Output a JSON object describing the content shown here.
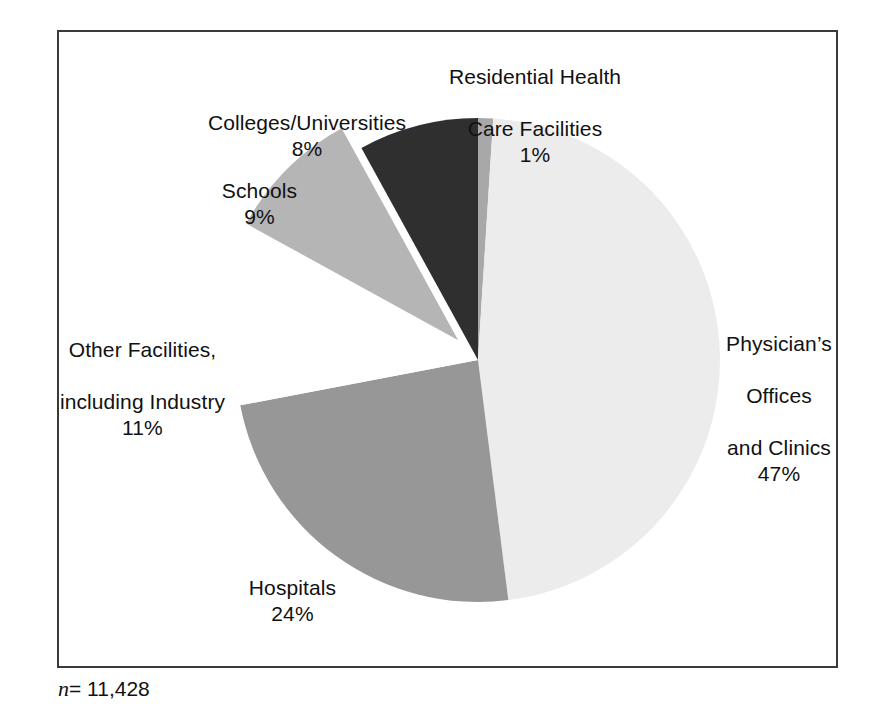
{
  "figure": {
    "footnote_symbol": "n",
    "footnote_value": "= 11,428",
    "frame_color": "#3a3a3a",
    "background": "#ffffff"
  },
  "chart_data": {
    "type": "pie",
    "title": "",
    "subtitle": "",
    "xlabel": "",
    "ylabel": "",
    "legend_position": "none",
    "grid": false,
    "total_label": "n = 11,428",
    "total": 11428,
    "start_angle_deg": 0,
    "direction": "clockwise",
    "categories": [
      "Residential Health Care Facilities",
      "Physician's Offices and Clinics",
      "Hospitals",
      "Other Facilities, including Industry",
      "Schools",
      "Colleges/Universities"
    ],
    "values": [
      1,
      47,
      24,
      11,
      9,
      8
    ],
    "value_labels": [
      "1%",
      "47%",
      "24%",
      "11%",
      "9%",
      "8%"
    ],
    "colors": [
      "#a8a8a8",
      "#ececec",
      "#979797",
      "#ffffff",
      "#b5b5b5",
      "#2f2f2f"
    ],
    "exploded": [
      false,
      false,
      false,
      false,
      true,
      false
    ],
    "slices": [
      {
        "name": "Residential Health Care Facilities",
        "label_line1": "Residential Health",
        "label_line2": "Care Facilities",
        "percent_label": "1%",
        "value": 1,
        "color": "#a8a8a8",
        "exploded": false
      },
      {
        "name": "Physician's Offices and Clinics",
        "label_line1": "Physician’s",
        "label_line2": "Offices",
        "label_line3": "and Clinics",
        "percent_label": "47%",
        "value": 47,
        "color": "#ececec",
        "exploded": false
      },
      {
        "name": "Hospitals",
        "label_line1": "Hospitals",
        "percent_label": "24%",
        "value": 24,
        "color": "#979797",
        "exploded": false
      },
      {
        "name": "Other Facilities, including Industry",
        "label_line1": "Other Facilities,",
        "label_line2": "including Industry",
        "percent_label": "11%",
        "value": 11,
        "color": "#ffffff",
        "exploded": false
      },
      {
        "name": "Schools",
        "label_line1": "Schools",
        "percent_label": "9%",
        "value": 9,
        "color": "#b5b5b5",
        "exploded": true
      },
      {
        "name": "Colleges/Universities",
        "label_line1": "Colleges/Universities",
        "percent_label": "8%",
        "value": 8,
        "color": "#2f2f2f",
        "exploded": false
      }
    ]
  }
}
